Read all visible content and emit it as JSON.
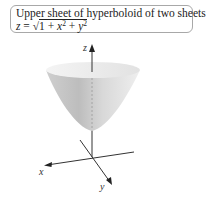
{
  "caption": {
    "title": "Upper sheet of hyperboloid of two sheets",
    "equation_lhs": "z",
    "equation_eq": " = ",
    "equation_sqrt": "√",
    "equation_one": "1 + ",
    "equation_x": "x",
    "equation_x_exp": "2",
    "equation_plus": " + ",
    "equation_y": "y",
    "equation_y_exp": "2"
  },
  "axes": {
    "x_label": "x",
    "y_label": "y",
    "z_label": "z"
  },
  "colors": {
    "surface_light": "#efefef",
    "surface_dark": "#bdbdbd",
    "axis": "#333333",
    "box_border": "#a8a8a8"
  }
}
